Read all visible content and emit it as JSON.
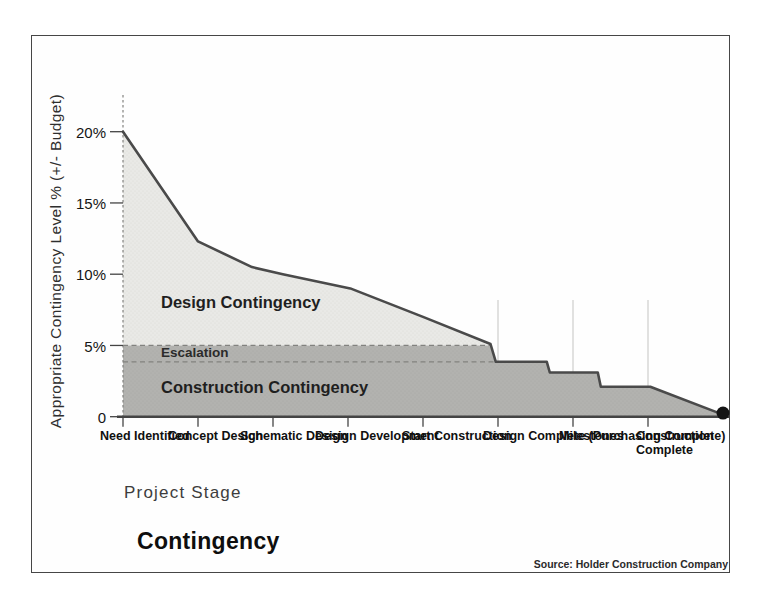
{
  "figure": {
    "title": "Contingency",
    "source": "Source: Holder Construction Company"
  },
  "chart_data": {
    "type": "area",
    "title": "Contingency",
    "xlabel": "Project Stage",
    "ylabel": "Appropriate Contingency Level % (+/- Budget)",
    "source": "Source: Holder Construction Company",
    "categories": [
      "Need\nIdentified",
      "Concept\nDesign",
      "Schematic\nDesign",
      "Design\nDevelopment",
      "Start\nConstruction",
      "Design\nComplete\n(Purchasing\nComplete)",
      "Milestones",
      "Construction\nComplete"
    ],
    "stage_values_pct": [
      20,
      12.3,
      10.2,
      9,
      7,
      5.1,
      3.1,
      2.1
    ],
    "y_ticks": [
      {
        "label": "20%",
        "pct": 20
      },
      {
        "label": "15%",
        "pct": 15
      },
      {
        "label": "10%",
        "pct": 10
      },
      {
        "label": "5%",
        "pct": 5
      },
      {
        "label": "0",
        "pct": 0
      }
    ],
    "ylim": [
      0,
      22.6
    ],
    "grid": "off",
    "legend": "labels drawn inside shaded areas",
    "top_line": [
      [
        0,
        20
      ],
      [
        1,
        12.3
      ],
      [
        1.72,
        10.5
      ],
      [
        2.13,
        10
      ],
      [
        3.03,
        9
      ],
      [
        4,
        7
      ],
      [
        4.9,
        5.1
      ],
      [
        4.97,
        3.85
      ],
      [
        5.65,
        3.85
      ],
      [
        5.69,
        3.1
      ],
      [
        6.33,
        3.1
      ],
      [
        6.37,
        2.1
      ],
      [
        7.03,
        2.1
      ],
      [
        8,
        0.15
      ]
    ],
    "design_area": [
      [
        0,
        20
      ],
      [
        1,
        12.3
      ],
      [
        1.72,
        10.5
      ],
      [
        2.13,
        10
      ],
      [
        3.03,
        9
      ],
      [
        4,
        7
      ],
      [
        4.9,
        5.1
      ],
      [
        4.9,
        5
      ],
      [
        0,
        5
      ]
    ],
    "construction_area": [
      [
        0,
        5
      ],
      [
        4.9,
        5
      ],
      [
        4.97,
        3.85
      ],
      [
        5.65,
        3.85
      ],
      [
        5.69,
        3.1
      ],
      [
        6.33,
        3.1
      ],
      [
        6.37,
        2.1
      ],
      [
        7.03,
        2.1
      ],
      [
        8,
        0.15
      ],
      [
        8,
        0
      ],
      [
        0,
        0
      ]
    ],
    "escalation_band": {
      "top_pct": 5,
      "bottom_pct": 3.85,
      "from_stage": 0,
      "to_stage": 4.95
    },
    "end_marker": {
      "stage": 8,
      "pct": 0.15
    },
    "area_labels": {
      "design": "Design Contingency",
      "escalation": "Escalation",
      "construction": "Construction Contingency"
    },
    "colors": {
      "design_fill": "#e9e9e6",
      "design_dot": "#d9d9d5",
      "construction_fill": "#b2b2af",
      "construction_dot": "#a7a7a3",
      "line": "#4a4a4a",
      "dashed": "#82827f",
      "axis": "#444444",
      "gridline": "#c9c9c6",
      "end_dot": "#141414",
      "frame": "#464646"
    }
  }
}
